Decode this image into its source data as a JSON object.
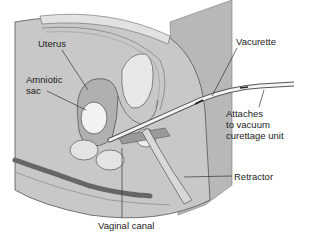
{
  "diagram": {
    "type": "anatomical-illustration",
    "labels": {
      "uterus": "Uterus",
      "amniotic_sac_line1": "Amniotic",
      "amniotic_sac_line2": "sac",
      "vacurette": "Vacurette",
      "attaches_line1": "Attaches",
      "attaches_line2": "to vacuum",
      "attaches_line3": "curettage unit",
      "retractor": "Retractor",
      "vaginal_canal": "Vaginal canal"
    },
    "colors": {
      "background": "#ffffff",
      "body_fill": "#c9c9c9",
      "tissue_dark": "#8a8a8a",
      "tissue_light": "#e8e8e8",
      "line": "#3a3a3a",
      "panel": "#b5b5b5"
    }
  }
}
